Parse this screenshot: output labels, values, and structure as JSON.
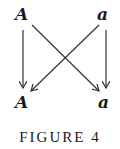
{
  "diagram": {
    "nodes": {
      "top_left": "A",
      "top_right": "a",
      "bottom_left": "A",
      "bottom_right": "a"
    },
    "edges": [
      {
        "from": "top_left",
        "to": "bottom_left"
      },
      {
        "from": "top_left",
        "to": "bottom_right"
      },
      {
        "from": "top_right",
        "to": "bottom_left"
      },
      {
        "from": "top_right",
        "to": "bottom_right"
      }
    ],
    "line_color": "#333333",
    "text_color": "#1a1a1a"
  },
  "caption": "FIGURE 4"
}
